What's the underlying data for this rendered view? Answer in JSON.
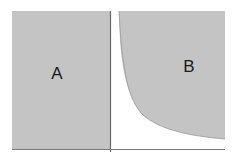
{
  "diagram": {
    "panels": [
      {
        "label": "A",
        "shape": "rectangle"
      },
      {
        "label": "B",
        "shape": "region-above-decaying-curve"
      }
    ],
    "colors": {
      "fill": "#c4c4c4",
      "axis": "#7a7a7a",
      "background": "#ffffff",
      "text": "#1a1a1a"
    }
  }
}
